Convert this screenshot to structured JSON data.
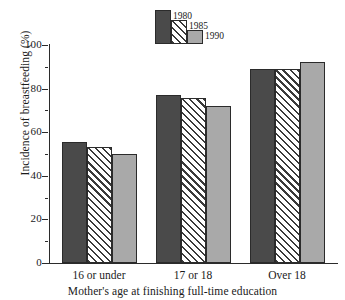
{
  "chart_data": {
    "type": "bar",
    "title": "",
    "subtitle": "",
    "xlabel": "Mother's age at finishing full-time education",
    "ylabel": "Incidence of breastfeeding (%)",
    "categories": [
      "16 or under",
      "17 or 18",
      "Over 18"
    ],
    "series": [
      {
        "name": "1980",
        "values": [
          55.5,
          77,
          89
        ],
        "color": "#4a4a4a",
        "fill": "solid-dark-gray"
      },
      {
        "name": "1985",
        "values": [
          53,
          75.5,
          89
        ],
        "color": "#ffffff",
        "fill": "diagonal-hatch"
      },
      {
        "name": "1990",
        "values": [
          50,
          72,
          92
        ],
        "color": "#a9a9a9",
        "fill": "solid-light-gray"
      }
    ],
    "ylim": [
      0,
      100
    ],
    "ytick_labels": [
      "0",
      "20",
      "40",
      "60",
      "80",
      "100"
    ],
    "ytick_values": [
      0,
      20,
      40,
      60,
      80,
      100
    ],
    "yminor_values": [
      10,
      30,
      50,
      70,
      90
    ],
    "grid": false,
    "legend_position": "top-center",
    "legend_entries": [
      "1980",
      "1985",
      "1990"
    ]
  },
  "figure": {
    "background": "#ffffff",
    "axis_color": "#2b2b2b",
    "bar_edge_color": "#2b2b2b"
  }
}
